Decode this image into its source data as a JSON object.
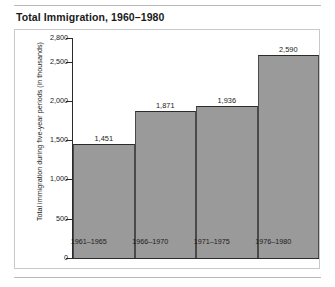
{
  "chart_data": {
    "type": "bar",
    "title": "Total Immigration, 1960–1980",
    "categories": [
      "1961–1965",
      "1966–1970",
      "1971–1975",
      "1976–1980"
    ],
    "values": [
      1451,
      1871,
      1936,
      2590
    ],
    "value_labels": [
      "1,451",
      "1,871",
      "1,936",
      "2,590"
    ],
    "xlabel": "",
    "ylabel": "Total immigration during five-year periods (in thousands)",
    "ylim": [
      0,
      2800
    ],
    "yticks": [
      0,
      500,
      1000,
      1500,
      2000,
      2500,
      2800
    ],
    "ytick_labels": [
      "0",
      "500",
      "1,000",
      "1,500",
      "2,000",
      "2,500",
      "2,800"
    ],
    "grid": false,
    "legend": false,
    "bar_color": "#9a9a9a",
    "bar_edge_color": "#2b2b2b",
    "background_color": "#ffffff"
  }
}
